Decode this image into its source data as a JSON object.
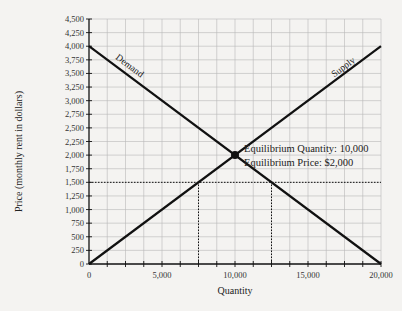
{
  "chart_data": {
    "type": "line",
    "title": "",
    "xlabel": "Quantity",
    "ylabel": "Price (monthly rent in dollars)",
    "xlim": [
      0,
      20000
    ],
    "ylim": [
      0,
      4500
    ],
    "grid": true,
    "x_ticks": [
      0,
      5000,
      10000,
      15000,
      20000
    ],
    "x_tick_labels": [
      "0",
      "5,000",
      "10,000",
      "15,000",
      "20,000"
    ],
    "x_minor_step": 1250,
    "y_ticks": [
      0,
      250,
      500,
      750,
      1000,
      1250,
      1500,
      1750,
      2000,
      2250,
      2500,
      2750,
      3000,
      3250,
      3500,
      3750,
      4000,
      4250,
      4500
    ],
    "y_tick_labels": [
      "0",
      "250",
      "500",
      "750",
      "1,000",
      "1,250",
      "1,500",
      "1,750",
      "2,000",
      "2,250",
      "2,500",
      "2,750",
      "3,000",
      "3,250",
      "3,500",
      "3,750",
      "4,000",
      "4,250",
      "4,500"
    ],
    "series": [
      {
        "name": "Demand",
        "x": [
          0,
          20000
        ],
        "y": [
          4000,
          0
        ]
      },
      {
        "name": "Supply",
        "x": [
          0,
          20000
        ],
        "y": [
          0,
          4000
        ]
      }
    ],
    "equilibrium": {
      "x": 10000,
      "y": 2000
    },
    "reference_lines": [
      {
        "type": "horizontal",
        "y": 1500,
        "style": "dotted"
      },
      {
        "type": "vertical",
        "x": 7500,
        "from": 0,
        "to": 1500,
        "style": "dotted"
      },
      {
        "type": "vertical",
        "x": 12500,
        "from": 0,
        "to": 1500,
        "style": "dotted"
      }
    ],
    "annotations": [
      "Equilibrium Quantity: 10,000",
      "Equilibrium Price: $2,000"
    ],
    "legend": "none (curves labeled inline)"
  },
  "labels": {
    "demand": "Demand",
    "supply": "Supply",
    "eq_quantity": "Equilibrium Quantity: 10,000",
    "eq_price": "Equilibrium Price: $2,000",
    "xlabel": "Quantity",
    "ylabel": "Price (monthly rent in dollars)"
  },
  "colors": {
    "background": "#f4f3f1",
    "grid": "#b8b8b8",
    "line": "#111111"
  }
}
